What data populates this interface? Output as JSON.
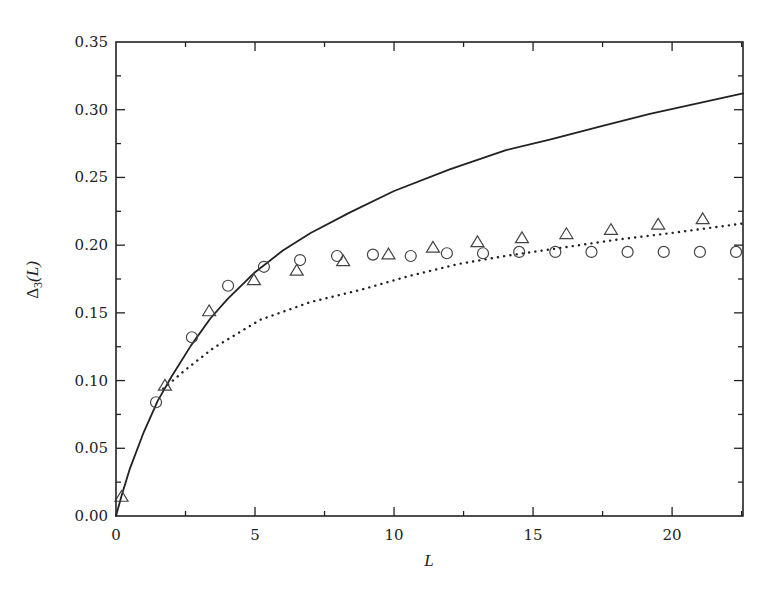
{
  "chart_data": {
    "type": "scatter",
    "title": "",
    "xlabel": "L",
    "ylabel": "Δ3(L)",
    "ylabel_parts": {
      "symbol": "Δ",
      "subscript": "3",
      "arg": "(L)"
    },
    "xlim": [
      0,
      22.55
    ],
    "ylim": [
      0,
      0.35
    ],
    "x_ticks": [
      0,
      5,
      10,
      15,
      20
    ],
    "x_tick_labels": [
      "0",
      "5",
      "10",
      "15",
      "20"
    ],
    "x_minor_step": 2.5,
    "y_ticks": [
      0.0,
      0.05,
      0.1,
      0.15,
      0.2,
      0.25,
      0.3,
      0.35
    ],
    "y_tick_labels": [
      "0.00",
      "0.05",
      "0.10",
      "0.15",
      "0.20",
      "0.25",
      "0.30",
      "0.35"
    ],
    "y_minor_step": 0.025,
    "grid": false,
    "legend": null,
    "series": [
      {
        "name": "solid-curve",
        "style": "line-solid",
        "color": "#222222",
        "x": [
          0,
          0.2,
          0.5,
          1.0,
          1.5,
          2.0,
          2.7,
          3.4,
          4.0,
          5.0,
          6.0,
          7.0,
          8.4,
          10.0,
          12.0,
          14.0,
          15.6,
          17.5,
          19.2,
          21.0,
          22.55
        ],
        "values": [
          0.0,
          0.015,
          0.035,
          0.062,
          0.085,
          0.103,
          0.126,
          0.146,
          0.16,
          0.18,
          0.196,
          0.209,
          0.224,
          0.24,
          0.256,
          0.27,
          0.278,
          0.288,
          0.297,
          0.305,
          0.312
        ]
      },
      {
        "name": "dotted-curve",
        "style": "line-dotted",
        "color": "#222222",
        "x": [
          1.7,
          2.5,
          3.5,
          5.2,
          7.0,
          8.8,
          10.5,
          12.3,
          14.0,
          16.0,
          18.0,
          20.0,
          22.55
        ],
        "values": [
          0.094,
          0.108,
          0.124,
          0.145,
          0.158,
          0.167,
          0.177,
          0.186,
          0.192,
          0.198,
          0.204,
          0.209,
          0.216
        ]
      },
      {
        "name": "circles",
        "style": "marker-circle",
        "color": "#444444",
        "x": [
          1.44,
          2.73,
          4.03,
          5.32,
          6.62,
          7.95,
          9.24,
          10.6,
          11.9,
          13.2,
          14.5,
          15.8,
          17.1,
          18.4,
          19.7,
          21.0,
          22.3
        ],
        "values": [
          0.084,
          0.132,
          0.17,
          0.184,
          0.189,
          0.192,
          0.193,
          0.192,
          0.194,
          0.194,
          0.195,
          0.195,
          0.195,
          0.195,
          0.195,
          0.195,
          0.195
        ]
      },
      {
        "name": "triangles",
        "style": "marker-triangle",
        "color": "#444444",
        "x": [
          0.2,
          1.76,
          3.35,
          4.96,
          6.5,
          8.17,
          9.8,
          11.4,
          13.0,
          14.6,
          16.2,
          17.8,
          19.5,
          21.1
        ],
        "values": [
          0.014,
          0.096,
          0.151,
          0.174,
          0.181,
          0.188,
          0.193,
          0.198,
          0.202,
          0.205,
          0.208,
          0.211,
          0.215,
          0.219
        ]
      }
    ]
  },
  "plot_area": {
    "left": 116,
    "top": 42,
    "right": 743,
    "bottom": 516
  }
}
